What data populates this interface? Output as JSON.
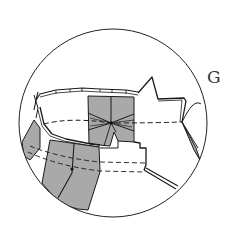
{
  "diagram": {
    "step_label": "G",
    "colors": {
      "fill": "#a9a9a9",
      "stroke": "#1a1a1a",
      "background": "#ffffff"
    }
  }
}
